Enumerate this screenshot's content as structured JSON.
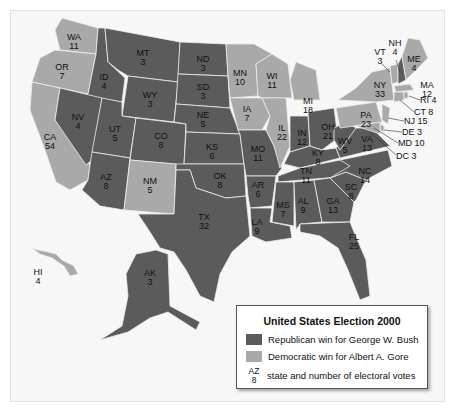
{
  "legend": {
    "title": "United States Election 2000",
    "republican_label": "Republican win for George W. Bush",
    "democratic_label": "Democratic win for Albert A. Gore",
    "example_abbr": "AZ",
    "example_votes": "8",
    "example_label": "state and number of electoral votes"
  },
  "colors": {
    "republican": "#5b5b5b",
    "democratic": "#a9a9a9",
    "border": "#e8e8e8"
  },
  "states": [
    {
      "abbr": "WA",
      "votes": "11",
      "winner": "D"
    },
    {
      "abbr": "OR",
      "votes": "7",
      "winner": "D"
    },
    {
      "abbr": "CA",
      "votes": "54",
      "winner": "D"
    },
    {
      "abbr": "ID",
      "votes": "4",
      "winner": "R"
    },
    {
      "abbr": "NV",
      "votes": "4",
      "winner": "R"
    },
    {
      "abbr": "MT",
      "votes": "3",
      "winner": "R"
    },
    {
      "abbr": "WY",
      "votes": "3",
      "winner": "R"
    },
    {
      "abbr": "UT",
      "votes": "5",
      "winner": "R"
    },
    {
      "abbr": "AZ",
      "votes": "8",
      "winner": "R"
    },
    {
      "abbr": "CO",
      "votes": "8",
      "winner": "R"
    },
    {
      "abbr": "NM",
      "votes": "5",
      "winner": "D"
    },
    {
      "abbr": "ND",
      "votes": "3",
      "winner": "R"
    },
    {
      "abbr": "SD",
      "votes": "3",
      "winner": "R"
    },
    {
      "abbr": "NE",
      "votes": "5",
      "winner": "R"
    },
    {
      "abbr": "KS",
      "votes": "6",
      "winner": "R"
    },
    {
      "abbr": "OK",
      "votes": "8",
      "winner": "R"
    },
    {
      "abbr": "TX",
      "votes": "32",
      "winner": "R"
    },
    {
      "abbr": "MN",
      "votes": "10",
      "winner": "D"
    },
    {
      "abbr": "IA",
      "votes": "7",
      "winner": "D"
    },
    {
      "abbr": "MO",
      "votes": "11",
      "winner": "R"
    },
    {
      "abbr": "AR",
      "votes": "6",
      "winner": "R"
    },
    {
      "abbr": "LA",
      "votes": "9",
      "winner": "R"
    },
    {
      "abbr": "WI",
      "votes": "11",
      "winner": "D"
    },
    {
      "abbr": "IL",
      "votes": "22",
      "winner": "D"
    },
    {
      "abbr": "MI",
      "votes": "18",
      "winner": "D"
    },
    {
      "abbr": "IN",
      "votes": "12",
      "winner": "R"
    },
    {
      "abbr": "OH",
      "votes": "21",
      "winner": "R"
    },
    {
      "abbr": "KY",
      "votes": "8",
      "winner": "R"
    },
    {
      "abbr": "TN",
      "votes": "11",
      "winner": "R"
    },
    {
      "abbr": "MS",
      "votes": "7",
      "winner": "R"
    },
    {
      "abbr": "AL",
      "votes": "9",
      "winner": "R"
    },
    {
      "abbr": "GA",
      "votes": "13",
      "winner": "R"
    },
    {
      "abbr": "FL",
      "votes": "25",
      "winner": "R"
    },
    {
      "abbr": "SC",
      "votes": "8",
      "winner": "R"
    },
    {
      "abbr": "NC",
      "votes": "14",
      "winner": "R"
    },
    {
      "abbr": "VA",
      "votes": "13",
      "winner": "R"
    },
    {
      "abbr": "WV",
      "votes": "5",
      "winner": "R"
    },
    {
      "abbr": "PA",
      "votes": "23",
      "winner": "D"
    },
    {
      "abbr": "NY",
      "votes": "33",
      "winner": "D"
    },
    {
      "abbr": "VT",
      "votes": "3",
      "winner": "D"
    },
    {
      "abbr": "NH",
      "votes": "4",
      "winner": "R"
    },
    {
      "abbr": "ME",
      "votes": "4",
      "winner": "D"
    },
    {
      "abbr": "MA",
      "votes": "12",
      "winner": "D"
    },
    {
      "abbr": "RI",
      "votes": "4",
      "winner": "D"
    },
    {
      "abbr": "CT",
      "votes": "8",
      "winner": "D"
    },
    {
      "abbr": "NJ",
      "votes": "15",
      "winner": "D"
    },
    {
      "abbr": "DE",
      "votes": "3",
      "winner": "D"
    },
    {
      "abbr": "MD",
      "votes": "10",
      "winner": "D"
    },
    {
      "abbr": "DC",
      "votes": "3",
      "winner": "D"
    },
    {
      "abbr": "HI",
      "votes": "4",
      "winner": "D"
    },
    {
      "abbr": "AK",
      "votes": "3",
      "winner": "R"
    }
  ],
  "side_labels": {
    "RI": "RI 4",
    "CT": "CT 8",
    "NJ": "NJ 15",
    "DE": "DE 3",
    "MD": "MD 10",
    "DC": "DC 3"
  }
}
